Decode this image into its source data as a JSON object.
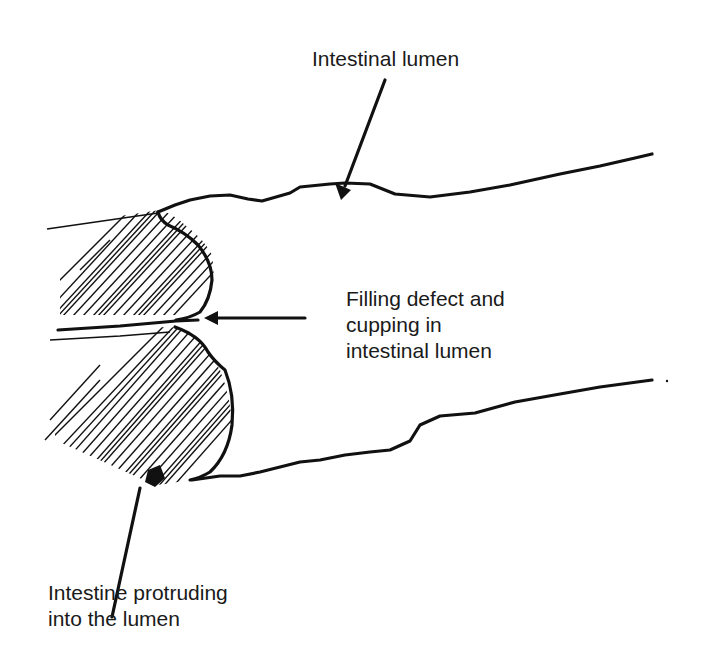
{
  "figure": {
    "type": "schematic line drawing",
    "background_color": "#ffffff",
    "ink_color": "#111111"
  },
  "labels": {
    "top": "Intestinal lumen",
    "right": "Filling defect and\ncupping in\nintestinal lumen",
    "bottom": "Intestine protruding\ninto the lumen"
  },
  "arrows": [
    {
      "name": "lumen-arrow",
      "from": [
        385,
        80
      ],
      "to": [
        341,
        196
      ]
    },
    {
      "name": "defect-arrow",
      "from": [
        305,
        318
      ],
      "to": [
        205,
        318
      ]
    },
    {
      "name": "protrusion-arrow",
      "from": [
        140,
        530
      ],
      "to": [
        112,
        617
      ]
    }
  ]
}
